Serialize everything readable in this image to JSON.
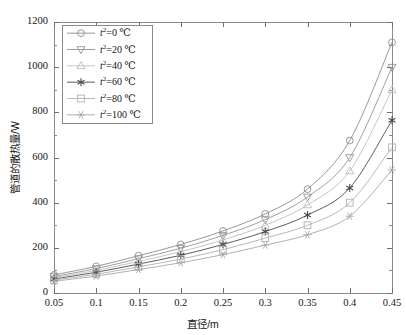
{
  "chart_data": {
    "type": "line",
    "title": "",
    "xlabel": "直径/m",
    "ylabel": "管道的散热量/W",
    "xlim": [
      0.05,
      0.45
    ],
    "ylim": [
      0,
      1200
    ],
    "xticks": [
      "0.05",
      "0.1",
      "0.15",
      "0.2",
      "0.25",
      "0.3",
      "0.35",
      "0.4",
      "0.45"
    ],
    "yticks": [
      "0",
      "200",
      "400",
      "600",
      "800",
      "1000",
      "1200"
    ],
    "x": [
      0.05,
      0.1,
      0.15,
      0.2,
      0.25,
      0.3,
      0.35,
      0.4,
      0.45
    ],
    "grid": false,
    "legend_position": "upper-left",
    "series": [
      {
        "name": "t²=0 ℃",
        "label_prefix": "t",
        "label_sup": "2",
        "label_suffix": "=0 ℃",
        "marker": "circle",
        "color": "#8c8c8c",
        "values": [
          80,
          118,
          165,
          215,
          275,
          350,
          460,
          675,
          1110
        ]
      },
      {
        "name": "t²=20 ℃",
        "label_prefix": "t",
        "label_sup": "2",
        "label_suffix": "=20 ℃",
        "marker": "triangle-down",
        "color": "#949494",
        "values": [
          73,
          108,
          152,
          198,
          255,
          325,
          425,
          600,
          1000
        ]
      },
      {
        "name": "t²=40 ℃",
        "label_prefix": "t",
        "label_sup": "2",
        "label_suffix": "=40 ℃",
        "marker": "triangle-up",
        "color": "#bdbdbd",
        "values": [
          68,
          100,
          140,
          183,
          235,
          300,
          390,
          540,
          900
        ]
      },
      {
        "name": "t²=60 ℃",
        "label_prefix": "t",
        "label_sup": "2",
        "label_suffix": "=60 ℃",
        "marker": "asterisk",
        "color": "#4a4a4a",
        "values": [
          62,
          92,
          128,
          167,
          215,
          272,
          345,
          465,
          765
        ]
      },
      {
        "name": "t²=80 ℃",
        "label_prefix": "t",
        "label_sup": "2",
        "label_suffix": "=80 ℃",
        "marker": "square",
        "color": "#b0b0b0",
        "values": [
          57,
          83,
          116,
          150,
          192,
          243,
          300,
          400,
          645
        ]
      },
      {
        "name": "t²=100 ℃",
        "label_prefix": "t",
        "label_sup": "2",
        "label_suffix": "=100 ℃",
        "marker": "star",
        "color": "#a8a8a8",
        "values": [
          52,
          75,
          104,
          134,
          170,
          212,
          258,
          340,
          545
        ]
      }
    ]
  },
  "axes": {
    "plot_left": 54,
    "plot_right": 392,
    "plot_top": 22,
    "plot_bottom": 293
  }
}
